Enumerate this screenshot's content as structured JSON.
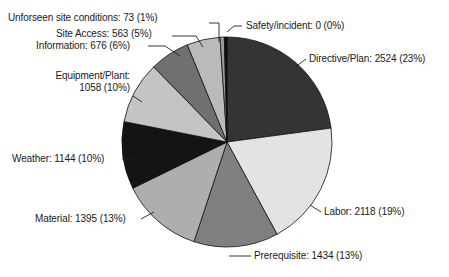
{
  "chart_data": {
    "type": "pie",
    "title": "",
    "subtitle": "",
    "xlabel": "",
    "ylabel": "",
    "legend_position": "none",
    "grid": false,
    "total": 10985,
    "categories": [
      "Directive/Plan",
      "Labor",
      "Prerequisite",
      "Material",
      "Weather",
      "Equipment/Plant",
      "Information",
      "Site Access",
      "Unforseen site conditions",
      "Safety/incident"
    ],
    "values": [
      2524,
      2118,
      1434,
      1395,
      1144,
      1058,
      676,
      563,
      73,
      0
    ],
    "percents": [
      23,
      19,
      13,
      13,
      10,
      10,
      6,
      5,
      1,
      0
    ],
    "colors": [
      "#343434",
      "#e3e3e3",
      "#808080",
      "#aeaeae",
      "#141414",
      "#c4c4c4",
      "#707070",
      "#bababa",
      "#9a9a9a",
      "#0d0d0d"
    ],
    "slices": [
      {
        "name": "Directive/Plan",
        "label": "Directive/Plan: 2524 (23%)",
        "value": 2524,
        "percent": 23,
        "color": "#343434"
      },
      {
        "name": "Labor",
        "label": "Labor: 2118 (19%)",
        "value": 2118,
        "percent": 19,
        "color": "#e3e3e3"
      },
      {
        "name": "Prerequisite",
        "label": "Prerequisite: 1434 (13%)",
        "value": 1434,
        "percent": 13,
        "color": "#808080"
      },
      {
        "name": "Material",
        "label": "Material: 1395 (13%)",
        "value": 1395,
        "percent": 13,
        "color": "#aeaeae"
      },
      {
        "name": "Weather",
        "label": "Weather: 1144 (10%)",
        "value": 1144,
        "percent": 10,
        "color": "#141414"
      },
      {
        "name": "Equipment/Plant",
        "label_line1": "Equipment/Plant:",
        "label_line2": "1058 (10%)",
        "label": "Equipment/Plant: 1058 (10%)",
        "value": 1058,
        "percent": 10,
        "color": "#c4c4c4"
      },
      {
        "name": "Information",
        "label": "Information: 676 (6%)",
        "value": 676,
        "percent": 6,
        "color": "#707070"
      },
      {
        "name": "Site Access",
        "label": "Site Access: 563 (5%)",
        "value": 563,
        "percent": 5,
        "color": "#bababa"
      },
      {
        "name": "Unforseen site conditions",
        "label": "Unforseen site conditions: 73 (1%)",
        "value": 73,
        "percent": 1,
        "color": "#9a9a9a"
      },
      {
        "name": "Safety/incident",
        "label": "Safety/incident: 0 (0%)",
        "value": 0,
        "percent": 0,
        "color": "#0d0d0d"
      }
    ]
  },
  "labels": {
    "unforseen": "Unforseen site conditions: 73 (1%)",
    "site_access": "Site Access: 563 (5%)",
    "information": "Information: 676 (6%)",
    "equipment_line1": "Equipment/Plant:",
    "equipment_line2": "1058 (10%)",
    "weather": "Weather: 1144 (10%)",
    "material": "Material: 1395 (13%)",
    "prerequisite": "Prerequisite: 1434 (13%)",
    "labor": "Labor: 2118 (19%)",
    "directive": "Directive/Plan: 2524 (23%)",
    "safety": "Safety/incident: 0 (0%)"
  }
}
